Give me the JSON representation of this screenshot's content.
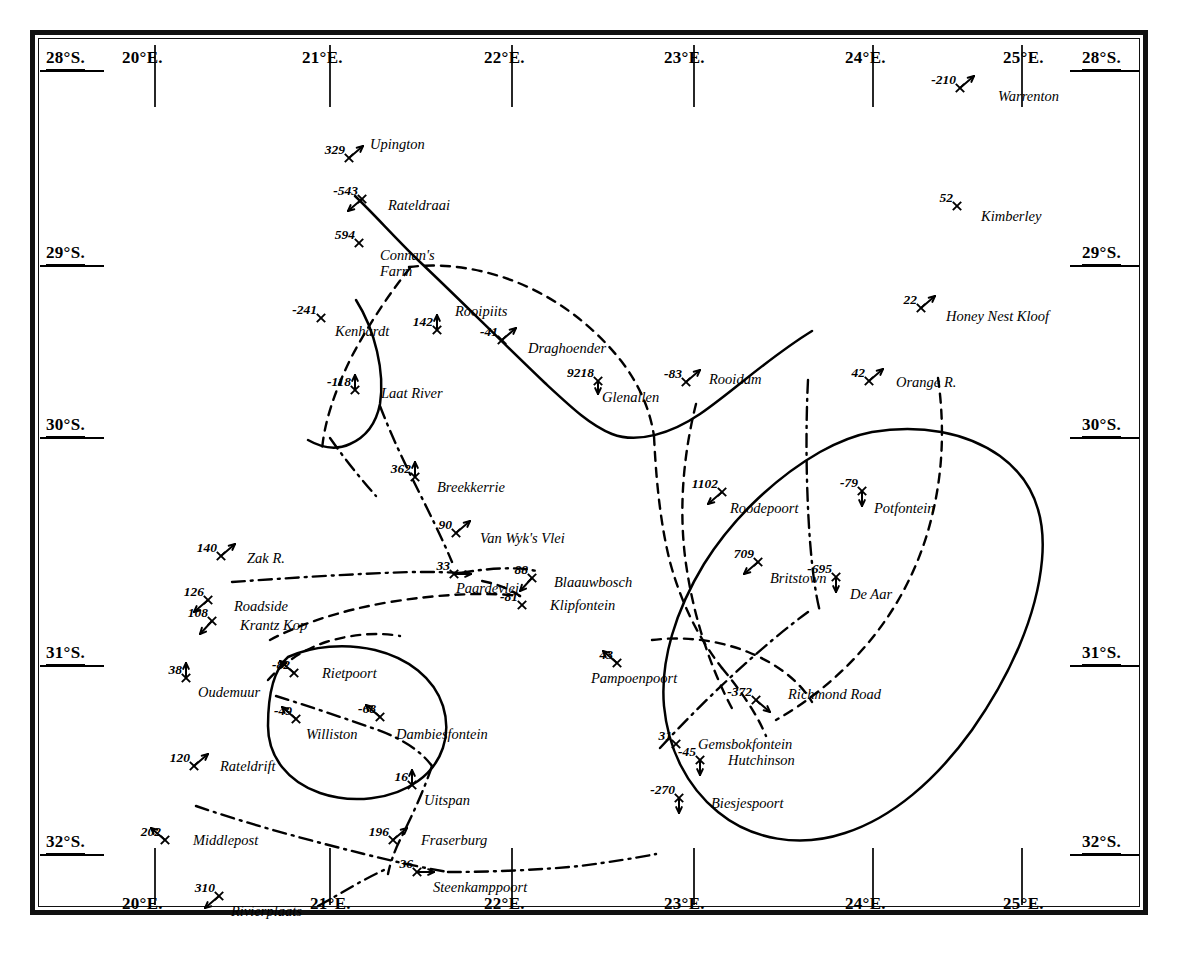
{
  "map": {
    "title": "Magnetic Declination Survey Map — Cape Colony",
    "projection_note": "",
    "background_color": "#ffffff",
    "ink_color": "#000000",
    "corner_labels": {
      "top_left": "28°S.",
      "top_right": "28°S.",
      "bottom_left": "20°E.",
      "bottom_right": "25°E."
    },
    "longitude_labels_top": [
      {
        "text": "20°E.",
        "x": 122,
        "y": 48
      },
      {
        "text": "21°E.",
        "x": 302,
        "y": 48
      },
      {
        "text": "22°E.",
        "x": 484,
        "y": 48
      },
      {
        "text": "23°E.",
        "x": 664,
        "y": 48
      },
      {
        "text": "24°E.",
        "x": 845,
        "y": 48
      },
      {
        "text": "25°E.",
        "x": 1003,
        "y": 48
      }
    ],
    "longitude_labels_bottom": [
      {
        "text": "20°E.",
        "x": 122,
        "y": 894
      },
      {
        "text": "21°E.",
        "x": 310,
        "y": 894
      },
      {
        "text": "22°E.",
        "x": 484,
        "y": 894
      },
      {
        "text": "23°E.",
        "x": 664,
        "y": 894
      },
      {
        "text": "24°E.",
        "x": 845,
        "y": 894
      },
      {
        "text": "25°E.",
        "x": 1003,
        "y": 894
      }
    ],
    "latitude_labels_left": [
      {
        "text": "28°S.",
        "x": 46,
        "y": 48
      },
      {
        "text": "29°S.",
        "x": 46,
        "y": 243
      },
      {
        "text": "30°S.",
        "x": 46,
        "y": 415
      },
      {
        "text": "31°S.",
        "x": 46,
        "y": 643
      },
      {
        "text": "32°S.",
        "x": 46,
        "y": 832
      }
    ],
    "latitude_labels_right": [
      {
        "text": "28°S.",
        "x": 1082,
        "y": 48
      },
      {
        "text": "29°S.",
        "x": 1082,
        "y": 243
      },
      {
        "text": "30°S.",
        "x": 1082,
        "y": 415
      },
      {
        "text": "31°S.",
        "x": 1082,
        "y": 643
      },
      {
        "text": "32°S.",
        "x": 1082,
        "y": 832
      }
    ],
    "longitude_ticks_top": [
      {
        "x": 155,
        "y0": 45,
        "y1": 107
      },
      {
        "x": 330,
        "y0": 45,
        "y1": 107
      },
      {
        "x": 512,
        "y0": 45,
        "y1": 107
      },
      {
        "x": 694,
        "y0": 45,
        "y1": 107
      },
      {
        "x": 873,
        "y0": 45,
        "y1": 107
      },
      {
        "x": 1022,
        "y0": 45,
        "y1": 107
      }
    ],
    "longitude_ticks_bottom": [
      {
        "x": 155,
        "y0": 848,
        "y1": 905
      },
      {
        "x": 330,
        "y0": 848,
        "y1": 905
      },
      {
        "x": 512,
        "y0": 848,
        "y1": 905
      },
      {
        "x": 694,
        "y0": 848,
        "y1": 905
      },
      {
        "x": 873,
        "y0": 848,
        "y1": 905
      },
      {
        "x": 1022,
        "y0": 848,
        "y1": 905
      }
    ],
    "latitude_tick_marks_left": [
      {
        "y": 71,
        "x0": 40,
        "x1": 104
      },
      {
        "y": 266,
        "x0": 40,
        "x1": 104
      },
      {
        "y": 438,
        "x0": 40,
        "x1": 104
      },
      {
        "y": 666,
        "x0": 40,
        "x1": 104
      },
      {
        "y": 855,
        "x0": 40,
        "x1": 104
      }
    ],
    "latitude_tick_marks_right": [
      {
        "y": 71,
        "x0": 1070,
        "x1": 1139
      },
      {
        "y": 266,
        "x0": 1070,
        "x1": 1139
      },
      {
        "y": 438,
        "x0": 1070,
        "x1": 1139
      },
      {
        "y": 666,
        "x0": 1070,
        "x1": 1139
      },
      {
        "y": 855,
        "x0": 1070,
        "x1": 1139
      }
    ]
  },
  "stations": [
    {
      "name": "Warrenton",
      "value": "-210",
      "x": 960,
      "y": 88,
      "val_dx": 0,
      "val_dy": 0,
      "name_dx": 38,
      "name_dy": 10,
      "marker": "arrow-ne"
    },
    {
      "name": "Upington",
      "value": "329",
      "x": 349,
      "y": 158,
      "val_dx": 0,
      "val_dy": 0,
      "name_dx": 21,
      "name_dy": -12,
      "marker": "arrow-ne"
    },
    {
      "name": "Kimberley",
      "value": "52",
      "x": 957,
      "y": 206,
      "val_dx": 0,
      "val_dy": 0,
      "name_dx": 24,
      "name_dy": 12,
      "marker": "star"
    },
    {
      "name": "Rateldraai",
      "value": "-543",
      "x": 362,
      "y": 199,
      "val_dx": 0,
      "val_dy": 0,
      "name_dx": 26,
      "name_dy": 8,
      "marker": "arrow-sw"
    },
    {
      "name": "Connan's Farm",
      "value": "594",
      "x": 359,
      "y": 243,
      "val_dx": 0,
      "val_dy": 0,
      "name_dx": 21,
      "name_dy": 14,
      "marker": "star",
      "second_line": "Farm"
    },
    {
      "name": "Honey Nest Kloof",
      "value": "22",
      "x": 921,
      "y": 308,
      "val_dx": 0,
      "val_dy": 0,
      "name_dx": 25,
      "name_dy": 10,
      "marker": "arrow-ne"
    },
    {
      "name": "Rooipiits",
      "value": "142",
      "x": 437,
      "y": 330,
      "val_dx": 0,
      "val_dy": 0,
      "name_dx": 18,
      "name_dy": -17,
      "marker": "star-up"
    },
    {
      "name": "Kenhardt",
      "value": "-241",
      "x": 321,
      "y": 318,
      "val_dx": 0,
      "val_dy": 0,
      "name_dx": 14,
      "name_dy": 15,
      "marker": "star"
    },
    {
      "name": "Draghoender",
      "value": "-41",
      "x": 502,
      "y": 340,
      "val_dx": 0,
      "val_dy": 0,
      "name_dx": 26,
      "name_dy": 10,
      "marker": "arrow-ne"
    },
    {
      "name": "Glenallen",
      "value": "9218",
      "x": 598,
      "y": 381,
      "val_dx": 0,
      "val_dy": 0,
      "name_dx": 4,
      "name_dy": 18,
      "marker": "star-below"
    },
    {
      "name": "Rooidam",
      "value": "-83",
      "x": 686,
      "y": 382,
      "val_dx": 0,
      "val_dy": 0,
      "name_dx": 23,
      "name_dy": -1,
      "marker": "arrow-ne"
    },
    {
      "name": "Orange R.",
      "value": "42",
      "x": 869,
      "y": 381,
      "val_dx": 0,
      "val_dy": 0,
      "name_dx": 27,
      "name_dy": 3,
      "marker": "arrow-ne"
    },
    {
      "name": "Laat River",
      "value": "-118",
      "x": 355,
      "y": 390,
      "val_dx": 0,
      "val_dy": 0,
      "name_dx": 26,
      "name_dy": 5,
      "marker": "star-up"
    },
    {
      "name": "Breekkerrie",
      "value": "362",
      "x": 415,
      "y": 477,
      "val_dx": 0,
      "val_dy": 0,
      "name_dx": 22,
      "name_dy": 12,
      "marker": "star-up"
    },
    {
      "name": "Roodepoort",
      "value": "1102",
      "x": 722,
      "y": 492,
      "val_dx": 0,
      "val_dy": 0,
      "name_dx": 8,
      "name_dy": 18,
      "marker": "arrow-sw"
    },
    {
      "name": "Potfontein",
      "value": "-79",
      "x": 862,
      "y": 491,
      "val_dx": 0,
      "val_dy": 0,
      "name_dx": 12,
      "name_dy": 19,
      "marker": "star-updown"
    },
    {
      "name": "Van Wyk's Vlei",
      "value": "90",
      "x": 456,
      "y": 533,
      "val_dx": 0,
      "val_dy": 0,
      "name_dx": 24,
      "name_dy": 7,
      "marker": "arrow-ne"
    },
    {
      "name": "Zak R.",
      "value": "140",
      "x": 221,
      "y": 556,
      "val_dx": 0,
      "val_dy": 0,
      "name_dx": 26,
      "name_dy": 4,
      "marker": "arrow-ne"
    },
    {
      "name": "Britstown",
      "value": "709",
      "x": 758,
      "y": 562,
      "val_dx": 0,
      "val_dy": 0,
      "name_dx": 12,
      "name_dy": 18,
      "marker": "arrow-sw",
      "value_after": true
    },
    {
      "name": "De Aar",
      "value": "-695",
      "x": 836,
      "y": 577,
      "val_dx": 0,
      "val_dy": 0,
      "name_dx": 14,
      "name_dy": 19,
      "marker": "star-down"
    },
    {
      "name": "Paardevlei",
      "value": "33",
      "x": 454,
      "y": 574,
      "val_dx": 0,
      "val_dy": 0,
      "name_dx": 2,
      "name_dy": 16,
      "marker": "arrow-lr"
    },
    {
      "name": "Blaauwbosch",
      "value": "88",
      "x": 532,
      "y": 578,
      "val_dx": 0,
      "val_dy": 0,
      "name_dx": 22,
      "name_dy": 6,
      "marker": "star-sw"
    },
    {
      "name": "Roadside",
      "value": "126",
      "x": 208,
      "y": 600,
      "val_dx": 0,
      "val_dy": 0,
      "name_dx": 26,
      "name_dy": 8,
      "marker": "arrow-sw"
    },
    {
      "name": "Klipfontein",
      "value": "-81",
      "x": 522,
      "y": 605,
      "val_dx": 0,
      "val_dy": 0,
      "name_dx": 28,
      "name_dy": 2,
      "marker": "star"
    },
    {
      "name": "Krantz Kop",
      "value": "108",
      "x": 212,
      "y": 621,
      "val_dx": 0,
      "val_dy": 0,
      "name_dx": 28,
      "name_dy": 6,
      "marker": "star-sw"
    },
    {
      "name": "Pampoenpoort",
      "value": "43",
      "x": 617,
      "y": 663,
      "val_dx": 0,
      "val_dy": 0,
      "name_dx": -26,
      "name_dy": 17,
      "marker": "arrow-nw"
    },
    {
      "name": "Rietpoort",
      "value": "-82",
      "x": 294,
      "y": 673,
      "val_dx": 0,
      "val_dy": 0,
      "name_dx": 28,
      "name_dy": 2,
      "marker": "arrow-nw"
    },
    {
      "name": "Oudemuur",
      "value": "38",
      "x": 186,
      "y": 678,
      "val_dx": 0,
      "val_dy": 0,
      "name_dx": 12,
      "name_dy": 16,
      "marker": "star-up"
    },
    {
      "name": "Richmond Road",
      "value": "-372",
      "x": 756,
      "y": 700,
      "val_dx": 0,
      "val_dy": 0,
      "name_dx": 32,
      "name_dy": -4,
      "marker": "arrow-se"
    },
    {
      "name": "Williston",
      "value": "-49",
      "x": 296,
      "y": 719,
      "val_dx": 0,
      "val_dy": 0,
      "name_dx": 10,
      "name_dy": 17,
      "marker": "arrow-nw"
    },
    {
      "name": "Dambiesfontein",
      "value": "-68",
      "x": 380,
      "y": 717,
      "val_dx": 0,
      "val_dy": 0,
      "name_dx": 16,
      "name_dy": 19,
      "marker": "arrow-nw"
    },
    {
      "name": "Gemsbokfontein",
      "value": "31",
      "x": 676,
      "y": 744,
      "val_dx": 0,
      "val_dy": 0,
      "name_dx": 22,
      "name_dy": 2,
      "marker": "star"
    },
    {
      "name": "Hutchinson",
      "value": "-45",
      "x": 700,
      "y": 760,
      "val_dx": 0,
      "val_dy": 0,
      "name_dx": 28,
      "name_dy": 2,
      "marker": "star-down"
    },
    {
      "name": "Rateldrift",
      "value": "120",
      "x": 194,
      "y": 766,
      "val_dx": 0,
      "val_dy": 0,
      "name_dx": 26,
      "name_dy": 2,
      "marker": "arrow-ne"
    },
    {
      "name": "Uitspan",
      "value": "16",
      "x": 412,
      "y": 785,
      "val_dx": 0,
      "val_dy": 0,
      "name_dx": 12,
      "name_dy": 17,
      "marker": "star-up"
    },
    {
      "name": "Biesjespoort",
      "value": "-270",
      "x": 679,
      "y": 798,
      "val_dx": 0,
      "val_dy": 0,
      "name_dx": 32,
      "name_dy": 7,
      "marker": "star-down"
    },
    {
      "name": "Middlepost",
      "value": "202",
      "x": 165,
      "y": 840,
      "val_dx": 0,
      "val_dy": 0,
      "name_dx": 28,
      "name_dy": 2,
      "marker": "arrow-nw"
    },
    {
      "name": "Fraserburg",
      "value": "196",
      "x": 393,
      "y": 840,
      "val_dx": 0,
      "val_dy": 0,
      "name_dx": 28,
      "name_dy": 2,
      "marker": "arrow-ne"
    },
    {
      "name": "Steenkamppoort",
      "value": "36",
      "x": 417,
      "y": 872,
      "val_dx": 0,
      "val_dy": 0,
      "name_dx": 16,
      "name_dy": 17,
      "marker": "arrow-lr"
    },
    {
      "name": "Rivierplaats",
      "value": "310",
      "x": 219,
      "y": 896,
      "val_dx": 0,
      "val_dy": 0,
      "name_dx": 12,
      "name_dy": 17,
      "marker": "arrow-sw"
    }
  ],
  "curves": {
    "solid": [
      {
        "name": "orange-river-line",
        "d": "M 355 196 C 372 212, 398 241, 420 262 C 452 292, 500 340, 545 383 C 572 408, 590 425, 612 434 C 638 444, 672 433, 700 414 C 736 389, 768 358, 812 331"
      },
      {
        "name": "kenhardt-arc",
        "d": "M 356 300 C 375 330, 385 372, 380 404 C 376 424, 366 437, 350 444 C 337 450, 322 448, 308 440"
      },
      {
        "name": "karoo-basin-outline",
        "d": "M 872 432 C 920 424, 966 432, 1000 456 C 1033 480, 1046 516, 1042 560 C 1037 616, 1010 676, 972 730 C 936 780, 892 818, 845 833 C 800 848, 752 840, 718 812 C 686 786, 668 748, 664 706 C 660 660, 676 610, 704 564 C 734 516, 778 476, 820 452 C 838 442, 856 435, 872 432 Z"
      },
      {
        "name": "williston-oval",
        "d": "M 288 657 C 312 646, 345 643, 375 650 C 408 658, 434 678, 443 706 C 452 735, 442 764, 418 781 C 392 800, 352 804, 320 793 C 288 782, 268 757, 268 726 C 268 698, 272 671, 288 657 Z"
      }
    ],
    "dashed": [
      {
        "name": "isogonal-dashed-north",
        "d": "M 409 267 C 448 262, 492 270, 530 288 C 570 307, 600 334, 622 362 C 640 386, 650 410, 654 436"
      },
      {
        "name": "isogonal-dashed-kenhardt",
        "d": "M 410 268 C 392 290, 370 322, 352 356 C 334 392, 324 424, 322 450"
      },
      {
        "name": "isogonal-dashed-central",
        "d": "M 654 436 C 656 478, 660 522, 670 562 C 682 606, 700 640, 722 668"
      },
      {
        "name": "isogonal-dashed-west",
        "d": "M 722 668 C 740 690, 756 712, 766 736"
      },
      {
        "name": "isogonal-dashed-deaar",
        "d": "M 938 378 C 944 420, 944 468, 932 516 C 920 566, 896 612, 862 650 C 836 680, 804 704, 776 720"
      },
      {
        "name": "isogonal-dashed-south-arc",
        "d": "M 696 404 C 684 452, 678 508, 686 564 C 694 620, 712 672, 734 712"
      },
      {
        "name": "isogonal-dashed-krantz",
        "d": "M 270 640 C 300 624, 342 610, 390 602 C 440 594, 486 592, 520 596"
      },
      {
        "name": "isogonal-dashed-paardevlei",
        "d": "M 520 596 C 508 588, 492 582, 476 580"
      },
      {
        "name": "isogonal-dashed-oval-top",
        "d": "M 268 680 C 282 664, 302 650, 326 642 C 352 634, 378 632, 400 636"
      },
      {
        "name": "isogonal-dashed-richmond",
        "d": "M 652 640 C 684 636, 718 640, 748 652 C 778 664, 800 682, 812 702"
      }
    ],
    "dashdot": [
      {
        "name": "magnetic-meridian-laat-breek",
        "d": "M 380 406 C 390 432, 402 458, 414 482 C 428 510, 442 538, 452 562"
      },
      {
        "name": "magnetic-meridian-zak",
        "d": "M 232 582 C 288 578, 350 574, 410 572 C 432 572, 448 572, 460 573"
      },
      {
        "name": "magnetic-meridian-paarde-east",
        "d": "M 460 573 C 490 568, 520 566, 540 572"
      },
      {
        "name": "magnetic-meridian-oval",
        "d": "M 276 696 C 308 706, 344 718, 378 730 C 402 739, 420 750, 432 766"
      },
      {
        "name": "magnetic-meridian-uitspan",
        "d": "M 432 766 C 424 790, 412 816, 400 840 C 394 852, 390 864, 388 874"
      },
      {
        "name": "magnetic-meridian-middlepost",
        "d": "M 196 806 C 248 824, 308 840, 364 854 C 396 862, 424 868, 448 872"
      },
      {
        "name": "magnetic-meridian-steenkamp",
        "d": "M 448 872 C 490 872, 540 870, 580 866 C 610 862, 636 858, 656 854"
      },
      {
        "name": "magnetic-meridian-river",
        "d": "M 318 906 C 340 894, 362 880, 384 870"
      },
      {
        "name": "magnetic-meridian-kenhardt-sw",
        "d": "M 330 438 C 344 458, 360 478, 376 496"
      },
      {
        "name": "magnetic-meridian-gemsbok",
        "d": "M 660 748 C 682 724, 708 698, 734 674 C 760 650, 786 628, 808 612"
      },
      {
        "name": "magnetic-meridian-britstown",
        "d": "M 808 380 C 806 420, 806 464, 808 508 C 810 552, 814 588, 820 612"
      }
    ]
  }
}
